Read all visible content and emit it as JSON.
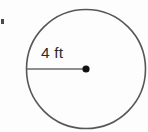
{
  "figure": {
    "kind": "geometry-diagram",
    "background_color": "#fdfdfd",
    "canvas": {
      "width": 148,
      "height": 132
    }
  },
  "circle": {
    "name": "circle-outline",
    "center_x": 86,
    "center_y": 69,
    "radius": 59.5,
    "stroke_color": "#575757",
    "stroke_width": 1.6,
    "fill": "none"
  },
  "radius_segment": {
    "name": "radius-line",
    "x1": 27,
    "y1": 69,
    "x2": 86,
    "y2": 69,
    "stroke_color": "#6a6a6a",
    "stroke_width": 1.4,
    "label": "4 ft",
    "measurement_value": "4",
    "measurement_unit": "ft"
  },
  "center_point": {
    "name": "center-dot",
    "cx": 86,
    "cy": 69,
    "r": 3.6,
    "fill_color": "#111111"
  },
  "label": {
    "text": "4 ft",
    "color": "#2b2b2b"
  },
  "artifact": {
    "name": "edge-speck",
    "color": "#4a4a4a"
  }
}
